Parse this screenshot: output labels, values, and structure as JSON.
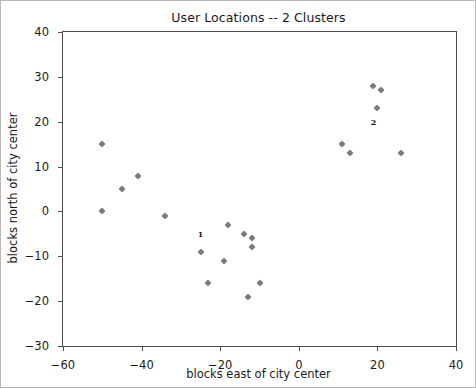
{
  "chart_data": {
    "type": "scatter",
    "title": "User Locations -- 2 Clusters",
    "xlabel": "blocks east of city center",
    "ylabel": "blocks north of city center",
    "xlim": [
      -60,
      40
    ],
    "ylim": [
      -30,
      40
    ],
    "xticks": [
      -60,
      -40,
      -20,
      0,
      20,
      40
    ],
    "yticks": [
      -30,
      -20,
      -10,
      0,
      10,
      20,
      30,
      40
    ],
    "grid": false,
    "legend": "none",
    "marker": "diamond",
    "marker_color": "#7a7a7a",
    "points": [
      {
        "x": -50,
        "y": 15
      },
      {
        "x": -50,
        "y": 0
      },
      {
        "x": -45,
        "y": 5
      },
      {
        "x": -41,
        "y": 8
      },
      {
        "x": -34,
        "y": -1
      },
      {
        "x": -25,
        "y": -9
      },
      {
        "x": -23,
        "y": -16
      },
      {
        "x": -19,
        "y": -11
      },
      {
        "x": -18,
        "y": -3
      },
      {
        "x": -14,
        "y": -5
      },
      {
        "x": -13,
        "y": -19
      },
      {
        "x": -12,
        "y": -8
      },
      {
        "x": -12,
        "y": -6
      },
      {
        "x": -10,
        "y": -16
      },
      {
        "x": 11,
        "y": 15
      },
      {
        "x": 13,
        "y": 13
      },
      {
        "x": 19,
        "y": 28
      },
      {
        "x": 20,
        "y": 23
      },
      {
        "x": 21,
        "y": 27
      },
      {
        "x": 26,
        "y": 13
      }
    ],
    "annotations": [
      {
        "label": "1",
        "x": -25,
        "y": -5
      },
      {
        "label": "2",
        "x": 19,
        "y": 20
      }
    ]
  }
}
